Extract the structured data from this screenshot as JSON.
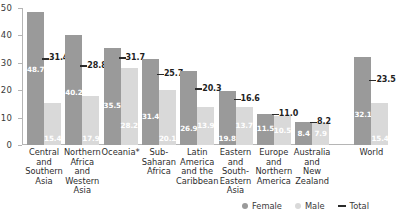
{
  "chart_data": {
    "type": "bar",
    "title": "",
    "subtitle": "",
    "xlabel": "",
    "ylabel": "",
    "ylim": [
      0,
      50
    ],
    "yticks": [
      "0",
      "10",
      "20",
      "30",
      "40",
      "50"
    ],
    "grid": false,
    "legend_position": "bottom-right",
    "categories": [
      "Central and Southern Asia",
      "Northern Africa and Western Asia",
      "Oceania*",
      "Sub-Saharan Africa",
      "Latin America and the Caribbean",
      "Eastern and South-Eastern Asia",
      "Europe and Northern America",
      "Australia and New Zealand",
      "World"
    ],
    "category_lines": [
      [
        "Central",
        "and",
        "Southern",
        "Asia"
      ],
      [
        "Northern",
        "Africa",
        "and",
        "Western",
        "Asia"
      ],
      [
        "Oceania*"
      ],
      [
        "Sub-",
        "Saharan",
        "Africa"
      ],
      [
        "Latin",
        "America",
        "and the",
        "Caribbean"
      ],
      [
        "Eastern",
        "and",
        "South-",
        "Eastern",
        "Asia"
      ],
      [
        "Europe",
        "and",
        "Northern",
        "America"
      ],
      [
        "Australia",
        "and",
        "New",
        "Zealand"
      ],
      [
        "World"
      ]
    ],
    "series": [
      {
        "name": "Female",
        "color": "#9a9a9a",
        "values": [
          48.7,
          40.2,
          35.5,
          31.4,
          26.9,
          19.8,
          11.5,
          8.4,
          32.1
        ],
        "labels": [
          "48.7",
          "40.2",
          "35.5",
          "31.4",
          "26.9",
          "19.8",
          "11.5",
          "8.4",
          "32.1"
        ]
      },
      {
        "name": "Male",
        "color": "#d9d9d9",
        "values": [
          15.4,
          17.9,
          28.2,
          20.1,
          13.9,
          13.7,
          10.5,
          7.9,
          15.4
        ],
        "labels": [
          "15.4",
          "17.9",
          "28.2",
          "20.1",
          "13.9",
          "13.7",
          "10.5",
          "7.9",
          "15.4"
        ]
      },
      {
        "name": "Total",
        "color": "#2b2b2b",
        "marker": "line",
        "values": [
          31.4,
          28.8,
          31.7,
          25.7,
          20.3,
          16.6,
          11.0,
          8.2,
          23.5
        ],
        "labels": [
          "31.4",
          "28.8",
          "31.7",
          "25.7",
          "20.3",
          "16.6",
          "11.0",
          "8.2",
          "23.5"
        ]
      }
    ]
  },
  "legend": {
    "items": [
      {
        "label": "Female",
        "icon": "dot-female"
      },
      {
        "label": "Male",
        "icon": "dot-male"
      },
      {
        "label": "Total",
        "icon": "dash-total"
      }
    ]
  }
}
